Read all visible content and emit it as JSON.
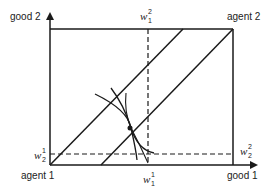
{
  "diagram": {
    "type": "edgeworth-box",
    "labels": {
      "y_axis": "good 2",
      "x_axis": "good 1",
      "origin_agent1": "agent 1",
      "origin_agent2": "agent 2"
    },
    "endowments": {
      "w1_2": {
        "base": "w",
        "sup": "2",
        "sub": "1"
      },
      "w2_1": {
        "base": "w",
        "sup": "1",
        "sub": "2"
      },
      "w2_2": {
        "base": "w",
        "sup": "2",
        "sub": "2"
      },
      "w1_1": {
        "base": "w",
        "sup": "1",
        "sub": "1"
      }
    },
    "colors": {
      "line": "#1a1a1a",
      "background": "#ffffff"
    }
  }
}
